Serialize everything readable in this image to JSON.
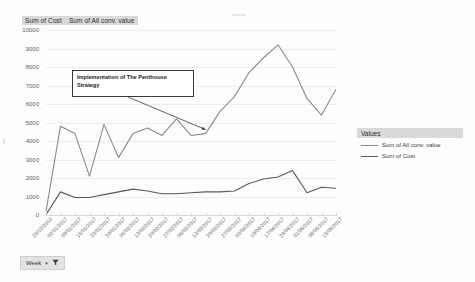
{
  "chart_title_fields": [
    "Sum of Cost",
    "Sum of All conv. value"
  ],
  "annotation": {
    "text": "Implementation of The Penthouse Strategy"
  },
  "legend": {
    "header": "Values",
    "items": [
      {
        "label": "Sum of All conv. value",
        "color": "#8a8a8a"
      },
      {
        "label": "Sum of Cost",
        "color": "#5a5a5a"
      }
    ]
  },
  "filter": {
    "label": "Week",
    "caret_icon": "chevron-down-icon",
    "funnel_icon": "funnel-filter-icon"
  },
  "yaxis_ticks": [
    "10000",
    "9000",
    "8000",
    "7000",
    "6000",
    "5000",
    "4000",
    "3000",
    "2000",
    "1000",
    "0"
  ],
  "stray_tick": ")",
  "chart_data": {
    "type": "line",
    "title": "Sum of Cost  Sum of All conv. value",
    "xlabel": "",
    "ylabel": "",
    "ylim": [
      0,
      10000
    ],
    "grid": true,
    "legend_position": "right",
    "categories": [
      "26/12/2016",
      "02/01/2017",
      "09/01/2017",
      "16/01/2017",
      "23/01/2017",
      "30/01/2017",
      "06/02/2017",
      "13/02/2017",
      "20/02/2017",
      "27/02/2017",
      "06/03/2017",
      "13/03/2017",
      "20/03/2017",
      "27/03/2017",
      "03/04/2017",
      "10/04/2017",
      "17/04/2017",
      "24/04/2017",
      "01/05/2017",
      "08/05/2017",
      "15/05/2017"
    ],
    "series": [
      {
        "name": "Sum of All conv. value",
        "color": "#8a8a8a",
        "values": [
          200,
          4800,
          4400,
          2100,
          4900,
          3100,
          4400,
          4700,
          4300,
          5200,
          4300,
          4400,
          5600,
          6400,
          7700,
          8500,
          9200,
          8000,
          6300,
          5400,
          6800
        ]
      },
      {
        "name": "Sum of Cost",
        "color": "#5a5a5a",
        "values": [
          20,
          1250,
          950,
          950,
          1100,
          1250,
          1400,
          1300,
          1150,
          1150,
          1200,
          1250,
          1250,
          1300,
          1700,
          1950,
          2050,
          2400,
          1200,
          1500,
          1450
        ]
      }
    ],
    "annotations": [
      {
        "text": "Implementation of The Penthouse Strategy",
        "arrow_from_category": "06/02/2017",
        "arrow_to_category": "13/03/2017"
      }
    ]
  }
}
